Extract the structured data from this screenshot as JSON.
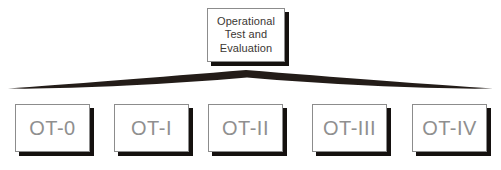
{
  "diagram": {
    "background_color": "#ffffff",
    "node_fill_color": "#ffffff",
    "node_border_color": "#8c8c8c",
    "shadow_color": "#15110f",
    "root_text_color": "#3b3733",
    "leaf_text_color": "#8f8f8f",
    "connector_color": "#231c18"
  },
  "root": {
    "label": "Operational\nTest and\nEvaluation",
    "line1": "Operational",
    "line2": "Test and",
    "line3": "Evaluation"
  },
  "connector": {
    "type": "tapered-brace",
    "apex_label": "brace-apex"
  },
  "leaves": [
    {
      "label": "OT-0",
      "name": "ot-0"
    },
    {
      "label": "OT-I",
      "name": "ot-i"
    },
    {
      "label": "OT-II",
      "name": "ot-ii"
    },
    {
      "label": "OT-III",
      "name": "ot-iii"
    },
    {
      "label": "OT-IV",
      "name": "ot-iv"
    }
  ]
}
